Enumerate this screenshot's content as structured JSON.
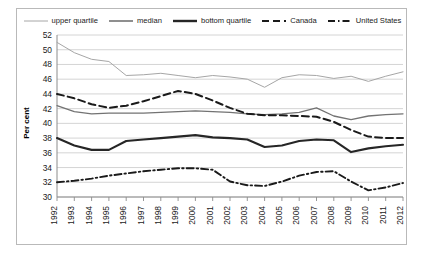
{
  "chart_data": {
    "type": "line",
    "title": "",
    "xlabel": "",
    "ylabel": "Per cent",
    "ylim": [
      30,
      52
    ],
    "ytick_step": 2,
    "yticks": [
      30,
      32,
      34,
      36,
      38,
      40,
      42,
      44,
      46,
      48,
      50,
      52
    ],
    "grid": true,
    "legend_position": "top",
    "categories": [
      1992,
      1993,
      1994,
      1995,
      1996,
      1997,
      1998,
      1999,
      2000,
      2001,
      2002,
      2003,
      2004,
      2005,
      2006,
      2007,
      2008,
      2009,
      2010,
      2011,
      2012
    ],
    "xtick_labels": [
      "1992",
      "1993",
      "1994",
      "1995",
      "1996",
      "1997",
      "1998",
      "1999",
      "2000",
      "2001",
      "2002",
      "2003",
      "2004",
      "2005",
      "2006",
      "2007",
      "2008",
      "2009",
      "2010",
      "2011",
      "2012"
    ],
    "series": [
      {
        "name": "upper quartile",
        "style": "solid-thin",
        "color": "#a6a6a6",
        "values": [
          51.0,
          49.6,
          48.7,
          48.4,
          46.5,
          46.6,
          46.8,
          46.5,
          46.2,
          46.5,
          46.3,
          46.0,
          44.9,
          46.2,
          46.6,
          46.5,
          46.1,
          46.4,
          45.7,
          46.4,
          47.0
        ]
      },
      {
        "name": "median",
        "style": "solid-medium",
        "color": "#737373",
        "values": [
          42.4,
          41.6,
          41.3,
          41.4,
          41.4,
          41.4,
          41.5,
          41.6,
          41.7,
          41.6,
          41.5,
          41.3,
          41.2,
          41.3,
          41.5,
          42.1,
          41.0,
          40.5,
          41.0,
          41.2,
          41.3
        ]
      },
      {
        "name": "bottom quartile",
        "style": "solid-thick",
        "color": "#262626",
        "values": [
          38.0,
          37.0,
          36.4,
          36.4,
          37.6,
          37.8,
          38.0,
          38.2,
          38.4,
          38.1,
          38.0,
          37.8,
          36.8,
          37.0,
          37.6,
          37.8,
          37.7,
          36.1,
          36.6,
          36.9,
          37.1
        ]
      },
      {
        "name": "Canada",
        "style": "dashed",
        "color": "#1a1a1a",
        "values": [
          44.0,
          43.4,
          42.6,
          42.1,
          42.4,
          43.0,
          43.7,
          44.4,
          44.0,
          43.1,
          42.1,
          41.3,
          41.1,
          41.1,
          41.0,
          40.9,
          40.2,
          39.1,
          38.2,
          38.0,
          38.0
        ]
      },
      {
        "name": "United States",
        "style": "dash-dot",
        "color": "#1a1a1a",
        "values": [
          32.0,
          32.2,
          32.5,
          32.9,
          33.2,
          33.5,
          33.7,
          33.9,
          33.9,
          33.7,
          32.1,
          31.6,
          31.5,
          32.1,
          32.9,
          33.4,
          33.5,
          32.1,
          30.9,
          31.3,
          31.9
        ]
      }
    ]
  },
  "legend": {
    "items": [
      {
        "label": "upper quartile",
        "key": "upper-quartile"
      },
      {
        "label": "median",
        "key": "median"
      },
      {
        "label": "bottom quartile",
        "key": "bottom-quartile"
      },
      {
        "label": "Canada",
        "key": "canada"
      },
      {
        "label": "United States",
        "key": "united-states"
      }
    ]
  },
  "axis": {
    "y_title": "Per cent"
  }
}
